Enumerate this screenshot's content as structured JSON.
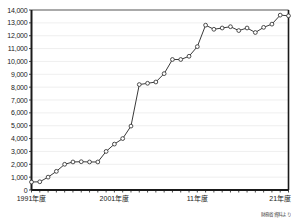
{
  "chart_data": {
    "type": "line",
    "title": "",
    "subtitle": "",
    "xlabel": "",
    "ylabel": "",
    "ylim": [
      0,
      14000
    ],
    "ytick_step": 1000,
    "grid": true,
    "legend": null,
    "marker": "open-circle",
    "line_color": "#3a3a3a",
    "marker_fill": "#ffffff",
    "grid_color": "#c8c8c8",
    "axis_color": "#1a1a1a",
    "ytick_labels": [
      "0",
      "1,000",
      "2,000",
      "3,000",
      "4,000",
      "5,000",
      "6,000",
      "7,000",
      "8,000",
      "9,000",
      "10,000",
      "11,000",
      "12,000",
      "13,000",
      "14,000"
    ],
    "ytick_values": [
      0,
      1000,
      2000,
      3000,
      4000,
      5000,
      6000,
      7000,
      8000,
      9000,
      10000,
      11000,
      12000,
      13000,
      14000
    ],
    "xtick_labels": [
      "1991年度",
      "2001年度",
      "11年度",
      "21年度"
    ],
    "xtick_x": [
      1991,
      2001,
      2011,
      2021
    ],
    "x": [
      1991,
      1992,
      1993,
      1994,
      1995,
      1996,
      1997,
      1998,
      1999,
      2000,
      2001,
      2002,
      2003,
      2004,
      2005,
      2006,
      2007,
      2008,
      2009,
      2010,
      2011,
      2012,
      2013,
      2014,
      2015,
      2016,
      2017,
      2018,
      2019,
      2020,
      2021,
      2022
    ],
    "values": [
      620,
      640,
      1000,
      1450,
      2000,
      2180,
      2200,
      2180,
      2180,
      3000,
      3570,
      4000,
      4970,
      8200,
      8300,
      8400,
      9050,
      10150,
      10150,
      10400,
      11150,
      12820,
      12500,
      12600,
      12700,
      12400,
      12600,
      12250,
      12650,
      12900,
      13600,
      13550
    ],
    "source_note": "財務省資料より"
  }
}
